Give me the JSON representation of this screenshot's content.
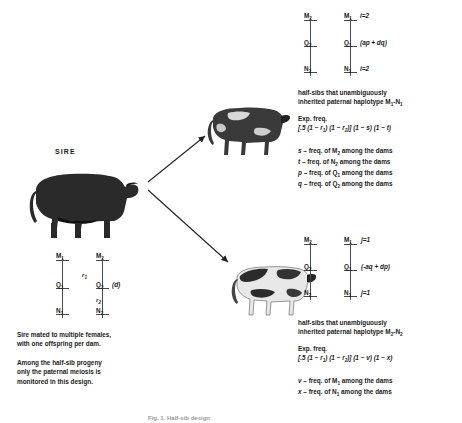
{
  "figure": {
    "sire_label": "SIRE",
    "caption_bottom": "Fig. 1. Half-sib design"
  },
  "sire": {
    "label": "SIRE",
    "animal_name": "black-bull",
    "haplotype_map": {
      "left_chromosome": [
        "M1",
        "Q1",
        "N1"
      ],
      "right_chromosome": [
        "M2",
        "Q2",
        "N2"
      ],
      "right_q_annotation": "(d)",
      "distances": [
        "r1",
        "r2"
      ],
      "loci": [
        {
          "id": "M1",
          "base": "M",
          "sub": "1"
        },
        {
          "id": "M2",
          "base": "M",
          "sub": "2"
        },
        {
          "id": "Q1",
          "base": "Q",
          "sub": "1"
        },
        {
          "id": "Q2",
          "base": "Q",
          "sub": "2"
        },
        {
          "id": "N1",
          "base": "N",
          "sub": "1"
        },
        {
          "id": "N2",
          "base": "N",
          "sub": "2"
        }
      ]
    },
    "notes": [
      "Sire mated to multiple females,",
      "with one offspring per dam.",
      "",
      "Among the half-sib progeny",
      "only the paternal meiosis is",
      "monitored in this design."
    ]
  },
  "progeny_top": {
    "animal_name": "dark-holstein-cow",
    "map": {
      "left_chromosome": [
        "M2",
        "Q2",
        "N2"
      ],
      "right_chromosome": [
        "M1",
        "Q1",
        "N1"
      ],
      "annotations": {
        "top_right": "i=2",
        "mid_right": "(ap + dq)",
        "bottom_right": "i=2"
      }
    },
    "description": [
      "half-sibs that unambiguously",
      "inherited paternal haplotype M1-N1"
    ],
    "exp_freq_label": "Exp. freq.",
    "exp_freq": "[.5 (1 − r1) (1 − r2)] (1 − s) (1 − t)",
    "definitions": [
      {
        "sym": "s",
        "text": "– freq. of M2 among the dams"
      },
      {
        "sym": "t",
        "text": "– freq. of N2 among the dams"
      },
      {
        "sym": "p",
        "text": "– freq. of Q1 among the dams"
      },
      {
        "sym": "q",
        "text": "– freq. of Q2 among the dams"
      }
    ]
  },
  "progeny_bottom": {
    "animal_name": "holstein-cow",
    "map": {
      "left_chromosome": [
        "M2",
        "Q2",
        "N2"
      ],
      "right_chromosome": [
        "M1",
        "Q1",
        "N1"
      ],
      "annotations": {
        "top_right": "j=1",
        "mid_right": "(-aq + dp)",
        "bottom_right": "j=1"
      }
    },
    "description": [
      "half-sibs that unambiguously",
      "inherited paternal haplotype M2-N2"
    ],
    "exp_freq_label": "Exp. freq.",
    "exp_freq": "[.5 (1 − r1) (1 − r2)] (1 − v) (1 − x)",
    "definitions": [
      {
        "sym": "v",
        "text": "– freq. of M1 among the dams"
      },
      {
        "sym": "x",
        "text": "– freq. of N1 among the dams"
      }
    ]
  },
  "colors": {
    "text": "#1a1a1a",
    "line": "#4a4a4a",
    "arrow": "#222222",
    "background": "#ffffff"
  }
}
